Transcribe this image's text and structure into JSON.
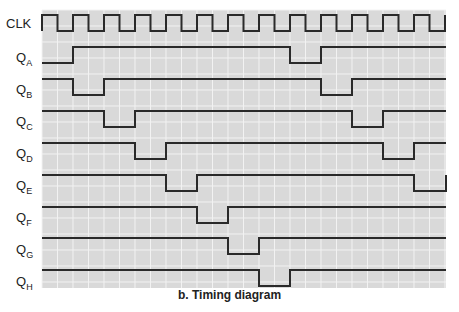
{
  "caption": "b. Timing diagram",
  "colors": {
    "grid_bg": "#d9d9d9",
    "grid_line": "#f2f2f2",
    "signal": "#2a2a2a",
    "text": "#222222"
  },
  "grid": {
    "x0": 42,
    "x1": 446,
    "y0": 10,
    "y1": 288,
    "pitch": 15.5
  },
  "clock": {
    "label": "CLK",
    "high_y": 15,
    "low_y": 31,
    "start_x": 42,
    "period": 31,
    "cycles": 13,
    "end_x": 446
  },
  "signals": [
    {
      "label": "Q",
      "sub": "A",
      "label_y": 62,
      "high_y": 47,
      "low_y": 63,
      "lows": [
        [
          42,
          73
        ],
        [
          290,
          321
        ]
      ]
    },
    {
      "label": "Q",
      "sub": "B",
      "label_y": 94,
      "high_y": 79,
      "low_y": 95,
      "lows": [
        [
          73,
          104
        ],
        [
          321,
          352
        ]
      ]
    },
    {
      "label": "Q",
      "sub": "C",
      "label_y": 126,
      "high_y": 111,
      "low_y": 127,
      "lows": [
        [
          104,
          135
        ],
        [
          352,
          383
        ]
      ]
    },
    {
      "label": "Q",
      "sub": "D",
      "label_y": 158,
      "high_y": 143,
      "low_y": 159,
      "lows": [
        [
          135,
          166
        ],
        [
          383,
          414
        ]
      ]
    },
    {
      "label": "Q",
      "sub": "E",
      "label_y": 190,
      "high_y": 175,
      "low_y": 191,
      "lows": [
        [
          166,
          197
        ],
        [
          414,
          446
        ]
      ]
    },
    {
      "label": "Q",
      "sub": "F",
      "label_y": 222,
      "high_y": 207,
      "low_y": 223,
      "lows": [
        [
          197,
          228
        ]
      ]
    },
    {
      "label": "Q",
      "sub": "G",
      "label_y": 254,
      "high_y": 238,
      "low_y": 254,
      "lows": [
        [
          228,
          259
        ]
      ]
    },
    {
      "label": "Q",
      "sub": "H",
      "label_y": 286,
      "high_y": 270,
      "low_y": 286,
      "lows": [
        [
          259,
          290
        ]
      ]
    }
  ]
}
